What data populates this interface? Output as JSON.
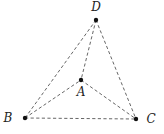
{
  "figure": {
    "points": [
      {
        "id": "A",
        "label": "A",
        "x": 81,
        "y": 80,
        "label_x": 81,
        "label_y": 96
      },
      {
        "id": "B",
        "label": "B",
        "x": 25,
        "y": 118,
        "label_x": 8,
        "label_y": 122
      },
      {
        "id": "C",
        "label": "C",
        "x": 136,
        "y": 119,
        "label_x": 151,
        "label_y": 123
      },
      {
        "id": "D",
        "label": "D",
        "x": 96,
        "y": 20,
        "label_x": 96,
        "label_y": 11
      }
    ],
    "edges": [
      {
        "from": "D",
        "to": "B",
        "style": "dashed"
      },
      {
        "from": "D",
        "to": "C",
        "style": "dashed"
      },
      {
        "from": "D",
        "to": "A",
        "style": "dashed"
      },
      {
        "from": "B",
        "to": "A",
        "style": "dashed"
      },
      {
        "from": "A",
        "to": "C",
        "style": "dashed"
      },
      {
        "from": "B",
        "to": "C",
        "style": "dashed"
      }
    ],
    "colors": {
      "edge": "#555555",
      "vertex": "#111111",
      "label": "#222222"
    }
  }
}
